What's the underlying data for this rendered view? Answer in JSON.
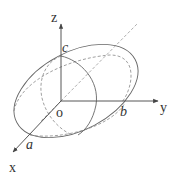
{
  "diagram": {
    "axes": {
      "x": {
        "label": "x"
      },
      "y": {
        "label": "y"
      },
      "z": {
        "label": "z"
      }
    },
    "origin_label": "o",
    "semi_axis_labels": {
      "a": "a",
      "b": "b",
      "c": "c"
    },
    "colors": {
      "stroke": "#555555",
      "dashed": "#888888",
      "text": "#333333"
    }
  }
}
